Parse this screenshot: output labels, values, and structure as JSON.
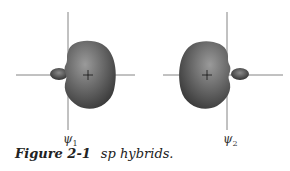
{
  "figure": {
    "label": "Figure 2-1",
    "title": "sp hybrids.",
    "orbitals": [
      {
        "symbol": "ψ",
        "subscript": "1",
        "large_lobe": "right"
      },
      {
        "symbol": "ψ",
        "subscript": "2",
        "large_lobe": "left"
      }
    ],
    "colors": {
      "lobe_dark": "#3d3d3d",
      "lobe_light": "#8a8a8a",
      "axis": "#555555"
    }
  }
}
